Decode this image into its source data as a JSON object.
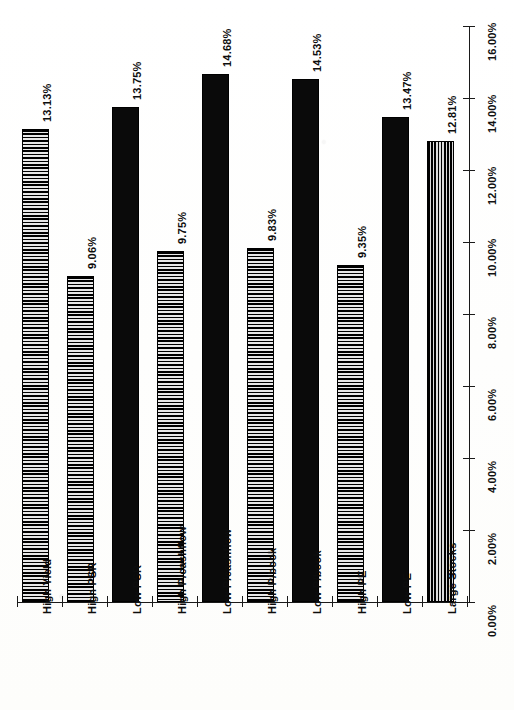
{
  "chart_data": {
    "type": "bar",
    "title": "",
    "subtitle": "",
    "xlabel": "",
    "ylabel": "",
    "orientation": "vertical-bars-rotated-page",
    "grid": false,
    "legend": "none",
    "ylim": [
      0,
      16
    ],
    "ytick_step": 2,
    "ytick_labels": [
      "0.00%",
      "2.00%",
      "4.00%",
      "6.00%",
      "8.00%",
      "10.00%",
      "12.00%",
      "14.00%",
      "16.00%"
    ],
    "ytick_values": [
      0,
      2,
      4,
      6,
      8,
      10,
      12,
      14,
      16
    ],
    "categories": [
      "High Yield",
      "High PSR",
      "Low PSR",
      "High P/cashflow",
      "Low P/cashflow",
      "High P/book",
      "Low P/book",
      "High PE",
      "Low PE",
      "Large Stocks"
    ],
    "values": [
      13.13,
      9.06,
      13.75,
      9.75,
      14.68,
      9.83,
      14.53,
      9.35,
      13.47,
      12.81
    ],
    "data_labels": [
      "13.13%",
      "9.06%",
      "13.75%",
      "9.75%",
      "14.68%",
      "9.83%",
      "14.53%",
      "9.35%",
      "13.47%",
      "12.81%"
    ],
    "bar_fills": [
      "horizontal-hatch",
      "horizontal-hatch",
      "solid-black",
      "horizontal-hatch",
      "solid-black",
      "horizontal-hatch",
      "solid-black",
      "horizontal-hatch",
      "solid-black",
      "vertical-hatch"
    ]
  },
  "colors": {
    "ink": "#0a0a0a",
    "paper": "#ffffff",
    "hatch_light": "#e8e8e8"
  }
}
